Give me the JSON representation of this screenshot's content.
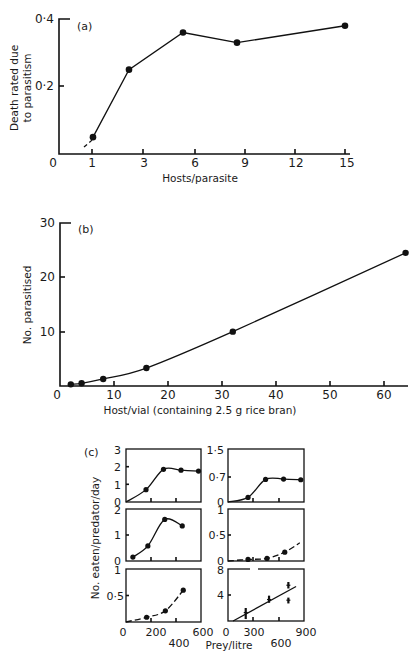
{
  "figure": {
    "panel_a": {
      "label": "(a)",
      "ylabel_line1": "Death rated due",
      "ylabel_line2": "to parasitism",
      "xlabel": "Hosts/parasite",
      "yticks": [
        "0·4",
        "0·2"
      ],
      "origin_label": "0",
      "xticks": [
        "1",
        "3",
        "6",
        "9",
        "12",
        "15"
      ]
    },
    "panel_b": {
      "label": "(b)",
      "ylabel": "No. parasitised",
      "xlabel": "Host/vial (containing 2.5 g rice bran)",
      "yticks": [
        "30",
        "20",
        "10"
      ],
      "origin_label": "0",
      "xticks": [
        "10",
        "20",
        "30",
        "40",
        "50",
        "60"
      ]
    },
    "panel_c": {
      "label": "(c)",
      "ylabel": "No. eaten/predator/day",
      "xlabel": "Prey/litre",
      "left_yticks": [
        [
          "3",
          "2",
          "1",
          "0"
        ],
        [
          "2",
          "1",
          "0"
        ],
        [
          "1",
          "0·5"
        ]
      ],
      "right_yticks": [
        [
          "1·5",
          "0·7",
          "0"
        ],
        [
          "1",
          "0·5",
          "0"
        ],
        [
          "8",
          "4"
        ]
      ],
      "left_xticks": {
        "row1": [
          "0",
          "200",
          "600"
        ],
        "row2": [
          "400"
        ]
      },
      "right_xticks": {
        "row1": [
          "0",
          "300",
          "900"
        ],
        "row2": [
          "600"
        ]
      }
    }
  },
  "chart_data": [
    {
      "type": "line",
      "title": "(a)",
      "xlabel": "Hosts/parasite",
      "ylabel": "Death rated due to parasitism",
      "x": [
        1,
        3,
        6,
        9,
        15
      ],
      "y": [
        0.05,
        0.25,
        0.36,
        0.33,
        0.38
      ],
      "xticks": [
        1,
        3,
        6,
        9,
        12,
        15
      ],
      "yticks": [
        0,
        0.2,
        0.4
      ],
      "xlim": [
        0,
        15.5
      ],
      "ylim": [
        0,
        0.4
      ],
      "grid": false,
      "markers": "filled circles",
      "dashed_extension": "short dashed extension below first point toward origin"
    },
    {
      "type": "line",
      "title": "(b)",
      "xlabel": "Host/vial (containing 2.5 g rice bran)",
      "ylabel": "No. parasitised",
      "x": [
        2,
        4,
        8,
        16,
        32,
        64
      ],
      "y": [
        0.3,
        0.5,
        1.3,
        3.3,
        10,
        24.5
      ],
      "curve": "smooth sigmoid fitted curve",
      "xticks": [
        0,
        10,
        20,
        30,
        40,
        50,
        60
      ],
      "yticks": [
        0,
        10,
        20,
        30
      ],
      "xlim": [
        0,
        65
      ],
      "ylim": [
        0,
        30
      ],
      "grid": false
    },
    {
      "type": "line",
      "title": "(c) left top",
      "xlabel": "Prey/litre",
      "ylabel": "No. eaten/predator/day",
      "x": [
        160,
        300,
        440,
        580
      ],
      "y": [
        0.7,
        1.85,
        1.8,
        1.75
      ],
      "xlim": [
        0,
        600
      ],
      "ylim": [
        0,
        3
      ],
      "yticks": [
        0,
        1,
        2,
        3
      ]
    },
    {
      "type": "line",
      "title": "(c) left middle",
      "xlabel": "Prey/litre",
      "ylabel": "No. eaten/predator/day",
      "x": [
        55,
        175,
        310,
        450
      ],
      "y": [
        0.15,
        0.58,
        1.6,
        1.35
      ],
      "xlim": [
        0,
        600
      ],
      "ylim": [
        0,
        2
      ],
      "yticks": [
        0,
        1,
        2
      ]
    },
    {
      "type": "line",
      "title": "(c) left bottom",
      "xlabel": "Prey/litre",
      "ylabel": "No. eaten/predator/day",
      "x": [
        165,
        315,
        458
      ],
      "y": [
        0.09,
        0.21,
        0.6
      ],
      "xlim": [
        0,
        600
      ],
      "ylim": [
        0,
        1
      ],
      "yticks": [
        0.5,
        1
      ],
      "xticks": [
        0,
        200,
        400,
        600
      ]
    },
    {
      "type": "line",
      "title": "(c) right top",
      "xlabel": "Prey/litre",
      "ylabel": "No. eaten/predator/day",
      "x": [
        237,
        445,
        658,
        862
      ],
      "y": [
        0.13,
        0.64,
        0.65,
        0.63
      ],
      "xlim": [
        0,
        900
      ],
      "ylim": [
        0,
        1.5
      ],
      "yticks": [
        0,
        0.7,
        1.5
      ]
    },
    {
      "type": "line",
      "title": "(c) right middle",
      "xlabel": "Prey/litre",
      "ylabel": "No. eaten/predator/day",
      "x": [
        237,
        462,
        672
      ],
      "y": [
        0.03,
        0.05,
        0.17
      ],
      "xlim": [
        0,
        900
      ],
      "ylim": [
        0,
        1
      ],
      "yticks": [
        0,
        0.5,
        1
      ]
    },
    {
      "type": "scatter",
      "title": "(c) right bottom",
      "xlabel": "Prey/litre",
      "ylabel": "No. eaten/predator/day",
      "x": [
        210,
        486,
        715,
        715
      ],
      "y": [
        1.3,
        3.3,
        5.5,
        3.2
      ],
      "error_low": [
        0.3,
        2.8,
        5.0,
        2.7
      ],
      "error_high": [
        2.0,
        3.9,
        6.0,
        3.6
      ],
      "fit_line": {
        "x": [
          60,
          806
        ],
        "y": [
          0,
          5.3
        ]
      },
      "xlim": [
        0,
        900
      ],
      "ylim": [
        0,
        8
      ],
      "yticks": [
        4,
        8
      ],
      "xticks": [
        0,
        300,
        600,
        900
      ]
    }
  ]
}
